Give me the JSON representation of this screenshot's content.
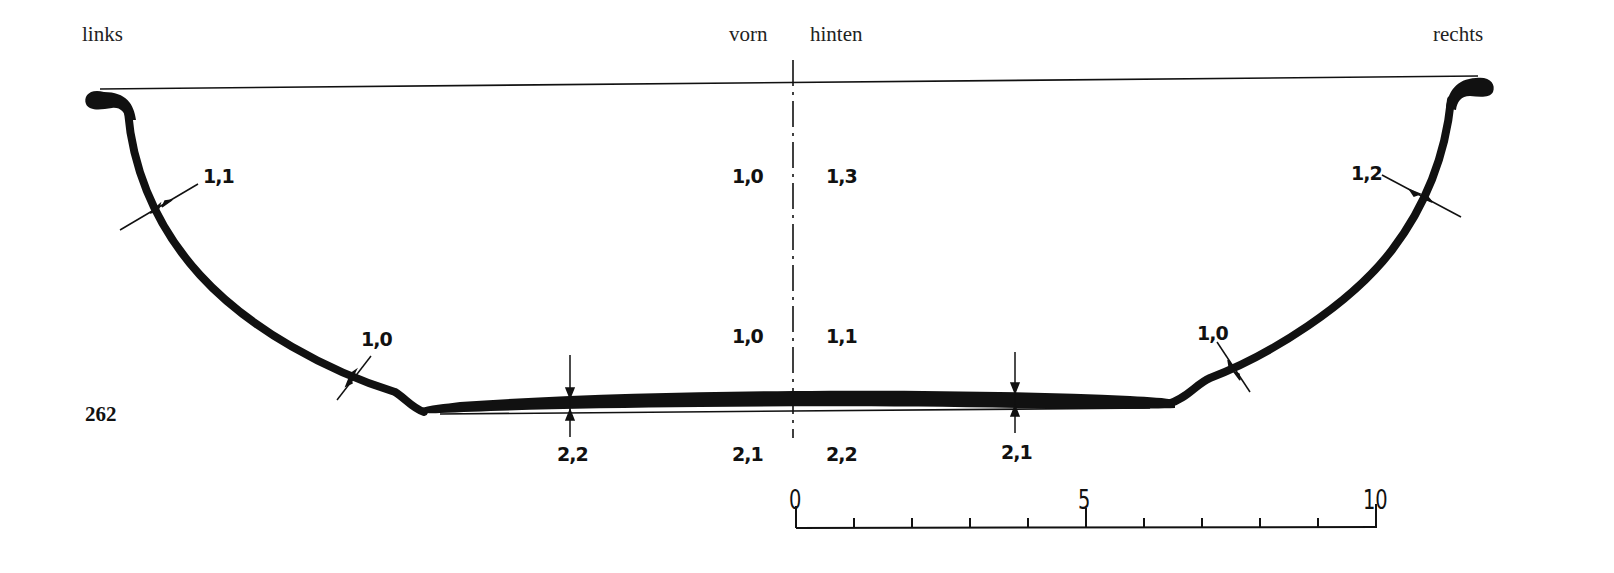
{
  "orientation_labels": {
    "left": "links",
    "front": "vorn",
    "back": "hinten",
    "right": "rechts"
  },
  "plate_number": "262",
  "wall_thickness": {
    "left_upper": "1,1",
    "left_lower": "1,0",
    "right_upper": "1,2",
    "right_lower": "1,0",
    "front_upper": "1,0",
    "back_upper": "1,3",
    "front_lower": "1,0",
    "back_lower": "1,1"
  },
  "base_thickness": {
    "left": "2,2",
    "front_center": "2,1",
    "back_center": "2,2",
    "right": "2,1"
  },
  "scale_bar": {
    "labels": [
      "0",
      "5",
      "10"
    ],
    "divisions": 10
  },
  "colors": {
    "ink": "#111111",
    "paper": "#ffffff"
  }
}
